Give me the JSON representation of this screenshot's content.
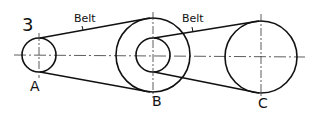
{
  "figure_number": "3",
  "belt_labels": [
    "Belt",
    "Belt"
  ],
  "pulleys": [
    {
      "label": "A"
    },
    {
      "label": "B"
    },
    {
      "label": "C"
    }
  ],
  "colors": {
    "line": "#111111",
    "background": "#ffffff"
  }
}
